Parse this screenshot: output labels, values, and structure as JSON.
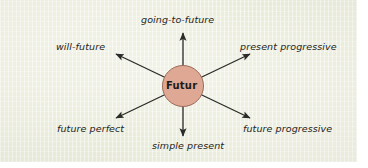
{
  "figure": {
    "kind": "radial-concept-diagram",
    "panel_color": "#eef0e0",
    "outer_color": "#ffffff"
  },
  "center": {
    "label": "Futur",
    "fill_color": "#dfa894",
    "stroke_color": "#9b6b58",
    "text_color": "#1d1c1a"
  },
  "arrows": {
    "color": "#2b2b28",
    "count": 6,
    "direction": "outward-from-center"
  },
  "nodes": [
    {
      "id": "going-to-future",
      "label": "going-to-future",
      "position": "top"
    },
    {
      "id": "will-future",
      "label": "will-future",
      "position": "top-left"
    },
    {
      "id": "present-progressive",
      "label": "present progressive",
      "position": "top-right"
    },
    {
      "id": "future-perfect",
      "label": "future perfect",
      "position": "bottom-left"
    },
    {
      "id": "simple-present",
      "label": "simple present",
      "position": "bottom"
    },
    {
      "id": "future-progressive",
      "label": "future progressive",
      "position": "bottom-right"
    }
  ]
}
